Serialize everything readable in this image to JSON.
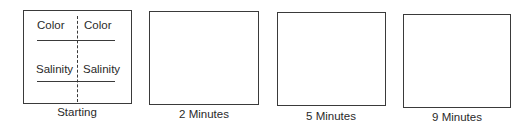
{
  "panels": [
    {
      "caption": "Starting",
      "left_labels": [
        "Color",
        "Salinity"
      ],
      "right_labels": [
        "Color",
        "Salinity"
      ],
      "divider": "dashed-vertical"
    },
    {
      "caption": "2 Minutes"
    },
    {
      "caption": "5 Minutes"
    },
    {
      "caption": "9 Minutes"
    }
  ],
  "colors": {
    "line": "#3a3a3a",
    "text": "#2a2a2a",
    "background": "#ffffff"
  }
}
